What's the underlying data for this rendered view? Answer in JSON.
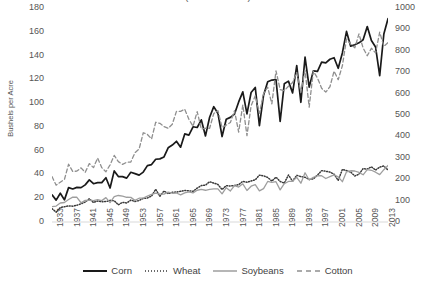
{
  "title": "(USDA NASS)",
  "axes": {
    "ylabel_left": "Bushels per Acre",
    "left_ticks": [
      "0",
      "20",
      "40",
      "60",
      "80",
      "100",
      "120",
      "140",
      "160",
      "180"
    ],
    "right_ticks": [
      "0",
      "100",
      "200",
      "300",
      "400",
      "500",
      "600",
      "700",
      "800",
      "900",
      "1000"
    ],
    "x_ticks": [
      "1933",
      "1937",
      "1941",
      "1945",
      "1949",
      "1953",
      "1957",
      "1961",
      "1965",
      "1969",
      "1973",
      "1977",
      "1981",
      "1985",
      "1989",
      "1993",
      "1997",
      "2001",
      "2005",
      "2009",
      "2013"
    ]
  },
  "legend": {
    "items": [
      {
        "label": "Corn",
        "style": "solid",
        "color": "#1a1a1a"
      },
      {
        "label": "Wheat",
        "style": "dotted",
        "color": "#3a3a3a"
      },
      {
        "label": "Soybeans",
        "style": "solid",
        "color": "#9e9e9e"
      },
      {
        "label": "Cotton",
        "style": "dashed",
        "color": "#8f8f8f"
      }
    ]
  },
  "chart_data": {
    "type": "line",
    "title": "(USDA NASS)",
    "xlabel": "",
    "ylabel": "Bushels per Acre",
    "ylabel_secondary": "Pounds per Acre",
    "ylim": [
      0,
      180
    ],
    "ylim_secondary": [
      0,
      1000
    ],
    "xlim": [
      1933,
      2014
    ],
    "grid": false,
    "legend_position": "bottom",
    "x": [
      1933,
      1934,
      1935,
      1936,
      1937,
      1938,
      1939,
      1940,
      1941,
      1942,
      1943,
      1944,
      1945,
      1946,
      1947,
      1948,
      1949,
      1950,
      1951,
      1952,
      1953,
      1954,
      1955,
      1956,
      1957,
      1958,
      1959,
      1960,
      1961,
      1962,
      1963,
      1964,
      1965,
      1966,
      1967,
      1968,
      1969,
      1970,
      1971,
      1972,
      1973,
      1974,
      1975,
      1976,
      1977,
      1978,
      1979,
      1980,
      1981,
      1982,
      1983,
      1984,
      1985,
      1986,
      1987,
      1988,
      1989,
      1990,
      1991,
      1992,
      1993,
      1994,
      1995,
      1996,
      1997,
      1998,
      1999,
      2000,
      2001,
      2002,
      2003,
      2004,
      2005,
      2006,
      2007,
      2008,
      2009,
      2010,
      2011,
      2012,
      2013,
      2014
    ],
    "series": [
      {
        "name": "Corn",
        "axis": "left",
        "units": "bushels per acre",
        "style": "solid",
        "color": "#1a1a1a",
        "values": [
          22.8,
          18.4,
          24.2,
          18.6,
          28.9,
          27.8,
          29.1,
          28.9,
          31.2,
          35.4,
          32.2,
          33.1,
          33.1,
          37.2,
          28.6,
          43.0,
          38.2,
          38.2,
          36.9,
          41.8,
          40.7,
          39.4,
          42.0,
          47.4,
          48.3,
          52.8,
          53.1,
          54.7,
          62.4,
          64.7,
          67.9,
          62.9,
          74.1,
          73.1,
          80.1,
          79.5,
          85.9,
          72.4,
          88.1,
          97.0,
          91.3,
          71.9,
          86.4,
          88.0,
          90.8,
          101.0,
          109.5,
          91.0,
          108.9,
          113.2,
          81.1,
          106.7,
          118.0,
          119.4,
          119.8,
          84.6,
          116.3,
          118.5,
          108.6,
          131.5,
          100.7,
          138.6,
          113.5,
          127.1,
          126.7,
          134.4,
          133.8,
          136.9,
          138.2,
          129.3,
          142.2,
          160.3,
          147.9,
          149.1,
          150.7,
          153.3,
          164.4,
          152.6,
          147.2,
          123.1,
          158.1,
          171.0
        ]
      },
      {
        "name": "Wheat",
        "axis": "left",
        "units": "bushels per acre",
        "style": "dotted",
        "color": "#3a3a3a",
        "values": [
          11.2,
          8.3,
          12.2,
          12.8,
          13.6,
          13.3,
          14.1,
          15.3,
          16.8,
          19.5,
          16.4,
          17.7,
          17.0,
          17.2,
          18.2,
          17.9,
          14.5,
          16.5,
          16.0,
          18.4,
          17.3,
          18.1,
          19.8,
          20.2,
          21.8,
          27.5,
          21.6,
          26.1,
          23.9,
          25.0,
          25.2,
          25.8,
          26.5,
          26.3,
          25.8,
          28.5,
          30.6,
          31.0,
          33.9,
          32.7,
          31.6,
          27.3,
          30.6,
          30.3,
          30.7,
          31.4,
          34.2,
          33.4,
          34.5,
          35.5,
          39.4,
          38.8,
          37.5,
          34.4,
          37.7,
          34.1,
          32.7,
          39.5,
          34.3,
          39.3,
          38.2,
          37.6,
          35.8,
          36.3,
          39.5,
          43.2,
          42.7,
          42.0,
          40.2,
          35.0,
          44.2,
          43.2,
          42.0,
          38.7,
          40.2,
          44.9,
          44.5,
          46.4,
          43.7,
          46.2,
          47.1,
          43.7
        ]
      },
      {
        "name": "Soybeans",
        "axis": "left",
        "units": "bushels per acre",
        "style": "solid",
        "color": "#9e9e9e",
        "values": [
          13.0,
          13.4,
          16.0,
          16.4,
          18.9,
          20.9,
          20.8,
          16.2,
          18.2,
          18.4,
          18.0,
          18.8,
          18.0,
          20.5,
          16.3,
          21.3,
          22.3,
          21.7,
          20.8,
          20.7,
          18.2,
          20.0,
          20.1,
          21.8,
          23.2,
          24.2,
          23.5,
          23.5,
          25.1,
          24.2,
          24.4,
          22.8,
          24.5,
          25.4,
          24.5,
          26.7,
          27.4,
          26.7,
          27.5,
          27.8,
          27.8,
          23.7,
          28.9,
          26.1,
          30.6,
          29.4,
          32.1,
          26.5,
          30.1,
          31.5,
          26.2,
          28.1,
          34.1,
          33.3,
          33.9,
          27.0,
          32.3,
          34.1,
          34.2,
          37.6,
          32.6,
          41.4,
          35.3,
          37.6,
          38.9,
          38.9,
          36.6,
          38.1,
          39.6,
          38.0,
          33.9,
          42.2,
          43.1,
          42.9,
          41.7,
          39.7,
          44.0,
          43.5,
          41.9,
          39.8,
          44.0,
          47.5
        ]
      },
      {
        "name": "Cotton",
        "axis": "right",
        "units": "pounds per acre",
        "style": "dashed",
        "color": "#8f8f8f",
        "values": [
          212,
          172,
          186,
          199,
          270,
          236,
          238,
          253,
          232,
          273,
          254,
          299,
          254,
          235,
          267,
          311,
          282,
          269,
          279,
          280,
          324,
          341,
          417,
          409,
          388,
          466,
          461,
          446,
          438,
          457,
          517,
          517,
          527,
          480,
          447,
          516,
          434,
          438,
          438,
          507,
          520,
          442,
          453,
          465,
          520,
          420,
          547,
          404,
          543,
          590,
          508,
          600,
          630,
          552,
          706,
          619,
          614,
          634,
          652,
          699,
          606,
          708,
          537,
          705,
          673,
          625,
          607,
          632,
          705,
          665,
          730,
          855,
          831,
          814,
          879,
          813,
          777,
          812,
          790,
          887,
          821,
          838
        ]
      }
    ]
  }
}
